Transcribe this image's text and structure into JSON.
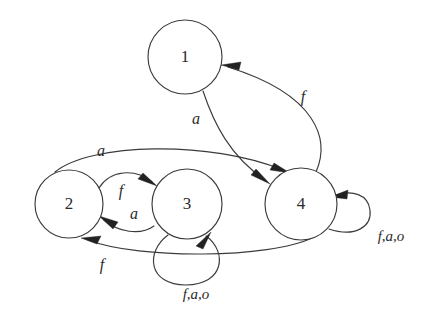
{
  "diagram": {
    "type": "finite-state-machine",
    "title": "",
    "background_color": "#ffffff",
    "stroke_color": "#3b3b3b",
    "label_color": "#2b2b2b",
    "states": [
      {
        "id": "1",
        "label": "1",
        "cx": 185,
        "cy": 57,
        "r": 37
      },
      {
        "id": "2",
        "label": "2",
        "cx": 69,
        "cy": 204,
        "r": 34
      },
      {
        "id": "3",
        "label": "3",
        "cx": 187,
        "cy": 204,
        "r": 35
      },
      {
        "id": "4",
        "label": "4",
        "cx": 301,
        "cy": 204,
        "r": 36
      }
    ],
    "transitions": [
      {
        "id": "t1-4",
        "from": "1",
        "to": "4",
        "label": "a",
        "label_x": 196,
        "label_y": 120
      },
      {
        "id": "t4-1",
        "from": "4",
        "to": "1",
        "label": "f",
        "label_x": 303,
        "label_y": 98
      },
      {
        "id": "t2-4",
        "from": "2",
        "to": "4",
        "label": "a",
        "label_x": 101,
        "label_y": 152
      },
      {
        "id": "t4-2",
        "from": "4",
        "to": "2",
        "label": "f",
        "label_x": 102,
        "label_y": 266
      },
      {
        "id": "t2-3",
        "from": "2",
        "to": "3",
        "label": "f",
        "label_x": 121,
        "label_y": 192
      },
      {
        "id": "t3-2",
        "from": "3",
        "to": "2",
        "label": "a",
        "label_x": 134,
        "label_y": 215
      },
      {
        "id": "t3-3",
        "from": "3",
        "to": "3",
        "label": "f,a,o",
        "label_x": 196,
        "label_y": 296
      },
      {
        "id": "t4-4",
        "from": "4",
        "to": "4",
        "label": "f,a,o",
        "label_x": 391,
        "label_y": 238
      }
    ]
  }
}
